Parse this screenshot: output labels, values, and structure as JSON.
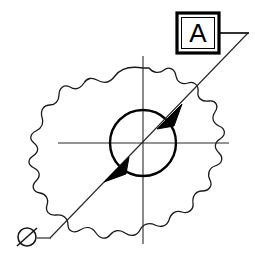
{
  "drawing": {
    "title": "Cylindricity / datum feature control callout on circular hole",
    "background_color": "#ffffff",
    "line_color": "#1a1a1a",
    "fill_color": "#000000",
    "canvas": {
      "width": 255,
      "height": 258
    },
    "datum_box": {
      "label": "A",
      "x": 177,
      "y": 13,
      "width": 42,
      "height": 40,
      "border_width": 3,
      "inner_border_width": 1
    },
    "leader": {
      "horizontal_start_x": 219,
      "horizontal_end_x": 248,
      "horizontal_y": 33,
      "diagonal_start_x": 248,
      "diagonal_start_y": 33,
      "diagonal_end_x": 50,
      "diagonal_end_y": 238
    },
    "diameter_symbol": {
      "glyph": "Ø",
      "center_x": 27,
      "center_y": 237,
      "radius": 9
    },
    "diameter_tail": {
      "start_x": 36,
      "start_y": 238,
      "end_x": 50,
      "end_y": 238
    },
    "hole_circle": {
      "center_x": 143,
      "center_y": 143,
      "radius": 33,
      "stroke_width": 2.4
    },
    "centerline_horizontal": {
      "x1": 58,
      "y1": 143,
      "x2": 229,
      "y2": 143
    },
    "centerline_vertical": {
      "x1": 143,
      "y1": 56,
      "x2": 143,
      "y2": 244
    },
    "arrowhead_upper": {
      "tip_x": 158,
      "tip_y": 128,
      "direction": "down-left",
      "label": "arrowhead-upper"
    },
    "arrowhead_lower": {
      "tip_x": 128,
      "tip_y": 158,
      "direction": "up-right",
      "label": "arrowhead-lower"
    },
    "break_outline": {
      "description": "irregular freehand break boundary of part body",
      "stroke_width": 1.3,
      "path": "M 143 68 C 131 66 121 68 115 76 C 110 83 104 84 97 80 C 92 77 87 78 84 83 C 80 89 75 90 70 87 C 64 84 59 88 59 95 C 59 101 55 105 50 105 C 44 105 40 110 42 117 C 44 123 42 128 36 131 C 30 134 29 139 34 143 C 39 147 39 152 33 156 C 27 160 28 165 34 168 C 40 171 41 176 36 181 C 31 186 33 192 40 193 C 46 194 49 199 47 205 C 45 211 49 216 56 215 C 63 214 68 218 68 225 C 68 231 74 234 80 230 C 86 226 92 227 96 233 C 100 239 106 240 110 235 C 114 230 120 229 125 233 C 131 237 137 236 140 230 C 143 224 149 222 155 225 C 161 228 167 226 169 220 C 171 213 176 210 182 212 C 188 214 194 210 193 203 C 192 196 196 191 202 191 C 209 191 213 186 210 180 C 207 174 209 168 215 166 C 222 164 224 158 219 153 C 214 148 214 143 220 139 C 226 135 226 129 219 126 C 213 123 211 118 215 112 C 219 106 216 100 209 101 C 202 102 197 98 198 92 C 199 85 194 81 188 83 C 182 85 177 82 176 76 C 175 69 169 66 164 70 C 159 74 153 73 149 68 Z"
    }
  },
  "annotations": {
    "datum_feature_symbol": "A",
    "diameter_prefix": "Ø"
  }
}
